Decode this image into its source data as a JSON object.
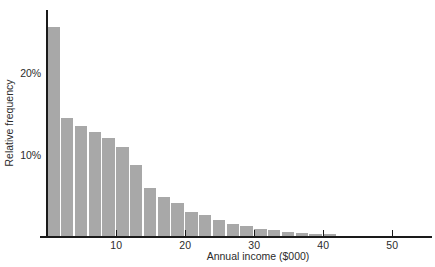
{
  "chart_data": {
    "type": "bar",
    "title": "",
    "subtitle": "",
    "xlabel": "Annual income ($000)",
    "ylabel": "Relative frequency",
    "xlim": [
      0,
      54
    ],
    "ylim": [
      0,
      27
    ],
    "grid": false,
    "legend": null,
    "bin_width": 2,
    "x_tick_labels": [
      "10",
      "20",
      "30",
      "40",
      "50"
    ],
    "x_ticks": [
      10,
      20,
      30,
      40,
      50
    ],
    "y_tick_labels": [
      "10%",
      "20%"
    ],
    "y_ticks": [
      10,
      20
    ],
    "bar_color": "#a8a8a8",
    "axis_color": "#1a1a1a",
    "categories": [
      "0-2",
      "2-4",
      "4-6",
      "6-8",
      "8-10",
      "10-12",
      "12-14",
      "14-16",
      "16-18",
      "18-20",
      "20-22",
      "22-24",
      "24-26",
      "26-28",
      "28-30",
      "30-32",
      "32-34",
      "34-36",
      "36-38",
      "38-40",
      "40-42"
    ],
    "bin_starts": [
      0,
      2,
      4,
      6,
      8,
      10,
      12,
      14,
      16,
      18,
      20,
      22,
      24,
      26,
      28,
      30,
      32,
      34,
      36,
      38,
      40
    ],
    "values": [
      25.6,
      14.5,
      13.5,
      12.8,
      12.1,
      10.9,
      8.8,
      6.0,
      4.8,
      4.1,
      3.0,
      2.6,
      2.1,
      1.6,
      1.3,
      1.0,
      0.8,
      0.6,
      0.5,
      0.4,
      0.4
    ]
  },
  "figure": {
    "background": "#ffffff",
    "x_axis_name": "x-axis",
    "y_axis_name": "y-axis"
  }
}
